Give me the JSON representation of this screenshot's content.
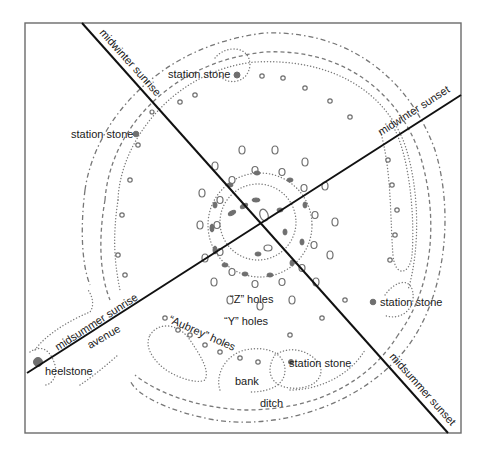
{
  "diagram": {
    "alignments": [
      {
        "id": "mw-sunrise",
        "label": "midwinter sunrise"
      },
      {
        "id": "mw-sunset",
        "label": "midwinter sunset"
      },
      {
        "id": "ms-sunrise",
        "label": "midsummer sunrise"
      },
      {
        "id": "ms-sunset",
        "label": "midsummer sunset"
      }
    ],
    "labels": {
      "station_stone_top": "station stone",
      "station_stone_left": "station stone",
      "station_stone_right": "station stone",
      "station_stone_bottom": "station stone",
      "z_holes": "“Z” holes",
      "y_holes": "“Y” holes",
      "aubrey_holes": "“Aubrey” holes",
      "avenue": "avenue",
      "heelstone": "heelstone",
      "bank": "bank",
      "ditch": "ditch"
    },
    "colors": {
      "axis_line": "#111111",
      "feature_stroke": "#6f6f6f",
      "frame": "#6b6b6b",
      "background": "#ffffff"
    }
  }
}
